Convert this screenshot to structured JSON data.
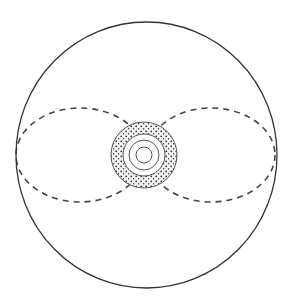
{
  "diagram": {
    "type": "schematic-sphere",
    "outer_sphere": {
      "cx": 146.5,
      "cy": 155,
      "rx": 130.5,
      "ry": 133,
      "stroke": "#333333"
    },
    "equator_ellipses": [
      {
        "cx": 78,
        "cy": 155,
        "rx": 62,
        "ry": 48,
        "dash": "6 5",
        "stroke": "#444444"
      },
      {
        "cx": 214,
        "cy": 155,
        "rx": 62,
        "ry": 48,
        "dash": "6 5",
        "stroke": "#444444"
      }
    ],
    "core": {
      "cx": 144,
      "cy": 155,
      "textured_ring": {
        "inner_r": 21,
        "outer_r": 33,
        "fill": "#e8e8e8",
        "stroke": "#555555"
      },
      "concentric_circles": [
        15,
        8
      ],
      "stroke": "#555555"
    }
  }
}
